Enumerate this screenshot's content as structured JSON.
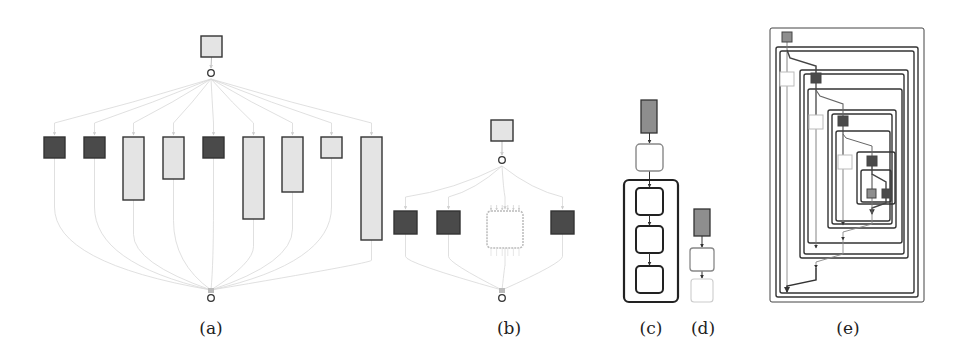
{
  "colors": {
    "dark": "#4a4a4a",
    "light": "#e4e4e4",
    "mid": "#8e8e8e",
    "stroke": "#333333",
    "edge": "#d8d8d8",
    "white": "#ffffff"
  },
  "panels": [
    {
      "id": "a",
      "caption": "(a)",
      "caption_x": 211,
      "caption_y": 318
    },
    {
      "id": "b",
      "caption": "(b)",
      "caption_x": 509,
      "caption_y": 318
    },
    {
      "id": "c",
      "caption": "(c)",
      "caption_x": 651,
      "caption_y": 318
    },
    {
      "id": "d",
      "caption": "(d)",
      "caption_x": 703,
      "caption_y": 318
    },
    {
      "id": "e",
      "caption": "(e)",
      "caption_x": 848,
      "caption_y": 318
    }
  ],
  "panel_a": {
    "source": {
      "x": 201,
      "y": 36,
      "w": 21,
      "h": 21
    },
    "fork": {
      "x": 211,
      "y": 73
    },
    "join": {
      "x": 211,
      "y": 298
    },
    "nodes": [
      {
        "x": 44,
        "y": 137,
        "w": 21,
        "h": 21,
        "fill": "dark"
      },
      {
        "x": 84,
        "y": 137,
        "w": 21,
        "h": 21,
        "fill": "dark"
      },
      {
        "x": 123,
        "y": 137,
        "w": 21,
        "h": 63,
        "fill": "light"
      },
      {
        "x": 163,
        "y": 137,
        "w": 21,
        "h": 42,
        "fill": "light"
      },
      {
        "x": 203,
        "y": 137,
        "w": 21,
        "h": 21,
        "fill": "dark"
      },
      {
        "x": 243,
        "y": 137,
        "w": 21,
        "h": 82,
        "fill": "light"
      },
      {
        "x": 282,
        "y": 137,
        "w": 21,
        "h": 55,
        "fill": "light"
      },
      {
        "x": 321,
        "y": 137,
        "w": 21,
        "h": 21,
        "fill": "light"
      },
      {
        "x": 361,
        "y": 137,
        "w": 21,
        "h": 103,
        "fill": "light"
      }
    ]
  },
  "panel_b": {
    "source": {
      "x": 491,
      "y": 120,
      "w": 22,
      "h": 21
    },
    "fork": {
      "x": 502,
      "y": 160
    },
    "join": {
      "x": 502,
      "y": 298
    },
    "nodes": [
      {
        "x": 394,
        "y": 211,
        "w": 23,
        "h": 23,
        "fill": "dark"
      },
      {
        "x": 437,
        "y": 211,
        "w": 23,
        "h": 23,
        "fill": "dark"
      },
      {
        "x": 487,
        "y": 211,
        "w": 36,
        "h": 37,
        "fill": "white",
        "collapsed": true
      },
      {
        "x": 551,
        "y": 211,
        "w": 23,
        "h": 23,
        "fill": "dark"
      }
    ]
  },
  "panel_c": {
    "top": {
      "x": 641,
      "y": 100,
      "w": 16,
      "h": 33,
      "fill": "mid"
    },
    "first": {
      "x": 636,
      "y": 144,
      "w": 27,
      "h": 27
    },
    "container": {
      "x": 624,
      "y": 180,
      "w": 54,
      "h": 122
    },
    "inner": [
      {
        "x": 636,
        "y": 188,
        "w": 27,
        "h": 27
      },
      {
        "x": 636,
        "y": 226,
        "w": 27,
        "h": 27
      },
      {
        "x": 636,
        "y": 266,
        "w": 27,
        "h": 27
      }
    ]
  },
  "panel_d": {
    "top": {
      "x": 694,
      "y": 209,
      "w": 16,
      "h": 27,
      "fill": "mid"
    },
    "middle": {
      "x": 690,
      "y": 248,
      "w": 24,
      "h": 23
    },
    "faded": {
      "x": 691,
      "y": 279,
      "w": 22,
      "h": 23
    }
  },
  "panel_e": {
    "frames": [
      {
        "x": 770,
        "y": 28,
        "w": 154,
        "h": 274
      },
      {
        "x": 776,
        "y": 47,
        "w": 142,
        "h": 250
      },
      {
        "x": 780,
        "y": 51,
        "w": 134,
        "h": 242
      },
      {
        "x": 800,
        "y": 70,
        "w": 108,
        "h": 188
      },
      {
        "x": 804,
        "y": 74,
        "w": 100,
        "h": 180
      },
      {
        "x": 808,
        "y": 89,
        "w": 94,
        "h": 154
      },
      {
        "x": 828,
        "y": 110,
        "w": 68,
        "h": 118
      },
      {
        "x": 832,
        "y": 114,
        "w": 60,
        "h": 110
      },
      {
        "x": 836,
        "y": 131,
        "w": 54,
        "h": 90
      },
      {
        "x": 857,
        "y": 152,
        "w": 38,
        "h": 52
      },
      {
        "x": 861,
        "y": 170,
        "w": 30,
        "h": 32
      }
    ],
    "nodes": [
      {
        "x": 782,
        "y": 32,
        "w": 10,
        "h": 10,
        "fill": "mid"
      },
      {
        "x": 780,
        "y": 72,
        "w": 14,
        "h": 14,
        "fill": "white"
      },
      {
        "x": 811,
        "y": 73,
        "w": 10,
        "h": 10,
        "fill": "dark"
      },
      {
        "x": 809,
        "y": 115,
        "w": 14,
        "h": 14,
        "fill": "white"
      },
      {
        "x": 838,
        "y": 116,
        "w": 10,
        "h": 10,
        "fill": "dark"
      },
      {
        "x": 838,
        "y": 155,
        "w": 14,
        "h": 14,
        "fill": "white"
      },
      {
        "x": 867,
        "y": 156,
        "w": 10,
        "h": 10,
        "fill": "dark"
      },
      {
        "x": 867,
        "y": 189,
        "w": 9,
        "h": 9,
        "fill": "mid"
      },
      {
        "x": 882,
        "y": 189,
        "w": 9,
        "h": 9,
        "fill": "dark"
      }
    ]
  }
}
